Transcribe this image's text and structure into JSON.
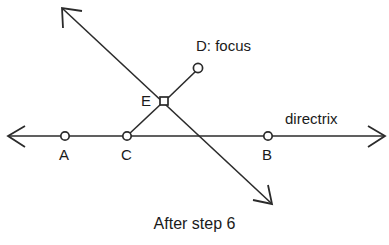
{
  "figure": {
    "caption": "After step 6",
    "background_color": "#ffffff",
    "stroke_color": "#2b2b2b",
    "text_color": "#1a1a1a",
    "width": 389,
    "height": 245
  },
  "labels": {
    "point_a": "A",
    "point_b": "B",
    "point_c": "C",
    "point_e": "E",
    "point_d": "D: focus",
    "directrix": "directrix"
  },
  "points": [
    {
      "id": "A",
      "label": "A",
      "marker": "circle",
      "x": 65,
      "y": 136,
      "on": "directrix"
    },
    {
      "id": "C",
      "label": "C",
      "marker": "circle",
      "x": 127,
      "y": 136,
      "on": "directrix"
    },
    {
      "id": "B",
      "label": "B",
      "marker": "circle",
      "x": 268,
      "y": 136,
      "on": "directrix"
    },
    {
      "id": "E",
      "label": "E",
      "marker": "square",
      "x": 164,
      "y": 101,
      "on": "intersection"
    },
    {
      "id": "D",
      "label": "D: focus",
      "marker": "circle",
      "x": 198,
      "y": 68,
      "on": "segment-ED"
    }
  ],
  "lines": [
    {
      "id": "directrix",
      "label": "directrix",
      "type": "double-arrow",
      "from": {
        "x": 8,
        "y": 136
      },
      "to": {
        "x": 385,
        "y": 136
      }
    },
    {
      "id": "perpendicular-bisector",
      "label": "",
      "type": "double-arrow",
      "from": {
        "x": 62,
        "y": 8
      },
      "to": {
        "x": 272,
        "y": 204
      }
    },
    {
      "id": "segment-CE",
      "label": "",
      "type": "segment",
      "from": {
        "x": 127,
        "y": 136
      },
      "to": {
        "x": 164,
        "y": 101
      }
    },
    {
      "id": "segment-ED",
      "label": "",
      "type": "segment",
      "from": {
        "x": 164,
        "y": 101
      },
      "to": {
        "x": 198,
        "y": 68
      }
    }
  ]
}
